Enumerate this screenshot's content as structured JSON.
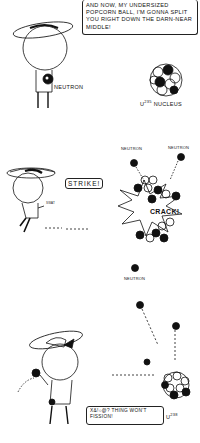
{
  "panels": [
    {
      "id": "panel-1",
      "speech": "And now, my undersized popcorn ball, I'm gonna split you right down the darn-near middle!",
      "labels": {
        "neutron": "Neutron",
        "nucleus_prefix": "U",
        "nucleus_isotope": "235",
        "nucleus_suffix": "Nucleus"
      }
    },
    {
      "id": "panel-2",
      "speech": "Strike!",
      "sound": "Crack!",
      "small_sfx": "Swat",
      "labels": {
        "neutron_left": "Neutron",
        "neutron_right": "Neutron",
        "neutron_bottom": "Neutron"
      }
    },
    {
      "id": "panel-3",
      "speech": "X&!○@? thing won't fission!",
      "labels": {
        "nucleus_prefix": "U",
        "nucleus_isotope": "238"
      }
    }
  ],
  "colors": {
    "ink": "#111111",
    "paper": "#ffffff"
  }
}
